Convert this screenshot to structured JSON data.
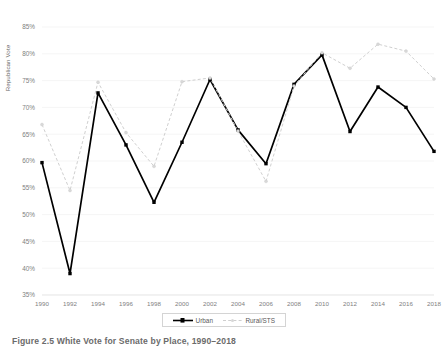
{
  "figure": {
    "caption": "Figure 2.5 White Vote for Senate by Place, 1990–2018"
  },
  "chart_data": {
    "type": "line",
    "title": "",
    "xlabel": "",
    "ylabel": "Republican Vote",
    "x": [
      1990,
      1992,
      1994,
      1996,
      1998,
      2000,
      2002,
      2004,
      2006,
      2008,
      2010,
      2012,
      2014,
      2016,
      2018
    ],
    "xtick_labels": [
      "1990",
      "1992",
      "1994",
      "1996",
      "1998",
      "2000",
      "2002",
      "2004",
      "2006",
      "2008",
      "2010",
      "2012",
      "2014",
      "2016",
      "2018"
    ],
    "ytick_labels": [
      "35%",
      "40%",
      "45%",
      "50%",
      "55%",
      "60%",
      "65%",
      "70%",
      "75%",
      "80%",
      "85%"
    ],
    "yticks": [
      35,
      40,
      45,
      50,
      55,
      60,
      65,
      70,
      75,
      80,
      85
    ],
    "ylim": [
      35,
      85
    ],
    "xlim": [
      1990,
      2018
    ],
    "grid": true,
    "legend_position": "bottom-center",
    "series": [
      {
        "name": "Urban",
        "color": "#000000",
        "style": "solid",
        "marker": "square",
        "values": [
          59.7,
          39.0,
          72.7,
          63.0,
          52.3,
          63.5,
          75.2,
          65.8,
          59.5,
          74.3,
          79.8,
          65.5,
          73.8,
          70.0,
          61.8
        ]
      },
      {
        "name": "Rural/STS",
        "color": "#d0d0d0",
        "style": "dashed",
        "marker": "circle",
        "values": [
          66.8,
          54.5,
          74.7,
          65.3,
          59.0,
          74.8,
          75.5,
          65.6,
          56.2,
          74.0,
          80.2,
          77.3,
          81.8,
          80.5,
          75.3
        ]
      }
    ]
  },
  "legend": {
    "items": [
      {
        "label": "Urban"
      },
      {
        "label": "Rural/STS"
      }
    ]
  }
}
